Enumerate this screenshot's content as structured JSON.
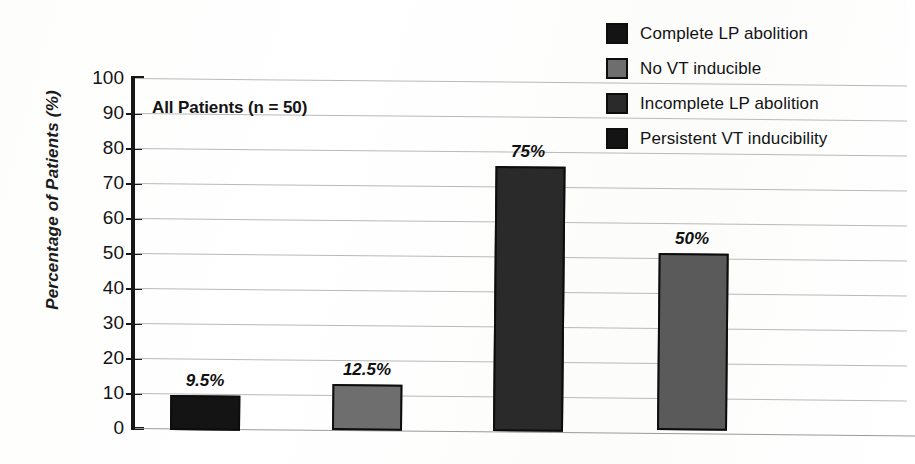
{
  "chart_data": {
    "type": "bar",
    "title": "",
    "subtitle": "",
    "annotation": "All Patients (n = 50)",
    "xlabel": "",
    "ylabel": "Percentage of Patients (%)",
    "ylim": [
      0,
      100
    ],
    "ytick_step": 10,
    "yticks": [
      100,
      90,
      80,
      70,
      60,
      50,
      40,
      30,
      20,
      10,
      0
    ],
    "ytick_labels": [
      "100",
      "90",
      "80",
      "70",
      "60",
      "50",
      "40",
      "30",
      "20",
      "10",
      "0"
    ],
    "grid": true,
    "grid_axis": "y",
    "legend_position": "top-right",
    "categories": [
      "Complete LP abolition",
      "No VT inducible",
      "Incomplete LP abolition",
      "Persistent VT inducibility"
    ],
    "values": [
      9.5,
      12.5,
      75,
      50
    ],
    "value_labels": [
      "9.5%",
      "12.5%",
      "75%",
      "50%"
    ],
    "bar_colors": [
      "#141414",
      "#6e6e6e",
      "#2a2a2a",
      "#5a5a5a"
    ],
    "bar_edge_color": "#0d0d0d",
    "series": [
      {
        "name": "Percentage of Patients",
        "points": [
          {
            "category": "Complete LP abolition",
            "value": 9.5,
            "label": "9.5%",
            "color": "#141414"
          },
          {
            "category": "No VT inducible",
            "value": 12.5,
            "label": "12.5%",
            "color": "#6e6e6e"
          },
          {
            "category": "Incomplete LP abolition",
            "value": 75,
            "label": "75%",
            "color": "#2a2a2a"
          },
          {
            "category": "Persistent VT inducibility",
            "value": 50,
            "label": "50%",
            "color": "#5a5a5a"
          }
        ]
      }
    ]
  },
  "legend": {
    "items": [
      {
        "label": "Complete LP abolition",
        "color": "#141414"
      },
      {
        "label": "No VT inducible",
        "color": "#6e6e6e"
      },
      {
        "label": "Incomplete LP abolition",
        "color": "#2a2a2a"
      },
      {
        "label": "Persistent VT inducibility",
        "color": "#141414"
      }
    ]
  },
  "axis": {
    "y_title": "Percentage of Patients (%)",
    "tick_labels": [
      "100",
      "90",
      "80",
      "70",
      "60",
      "50",
      "40",
      "30",
      "20",
      "10",
      "0"
    ]
  }
}
